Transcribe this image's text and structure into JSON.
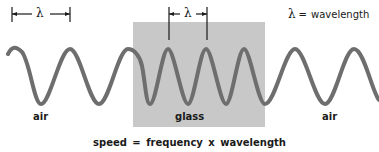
{
  "diagram": {
    "regions": [
      {
        "name": "air",
        "label": "air",
        "side": "left"
      },
      {
        "name": "glass",
        "label": "glass",
        "side": "middle"
      },
      {
        "name": "air",
        "label": "air",
        "side": "right"
      }
    ],
    "legend": {
      "symbol": "λ",
      "equals": "=",
      "meaning": "wavelength"
    },
    "markers": {
      "air_wavelength": {
        "symbol": "λ",
        "x_start": 12,
        "x_end": 70
      },
      "glass_wavelength": {
        "symbol": "λ",
        "x_start": 169,
        "x_end": 207
      }
    },
    "equation": "speed = frequency x wavelength",
    "colors": {
      "wave": "#6e6e6e",
      "glass": "#c8c8c8",
      "text": "#1a1a1a",
      "background": "#ffffff"
    },
    "geometry": {
      "glass_box": {
        "x": 133,
        "y": 22,
        "width": 132,
        "height": 105
      },
      "wave_peak_y": 49,
      "wave_trough_y": 104,
      "air_wavelength_px": 58,
      "glass_wavelength_px": 38
    }
  }
}
